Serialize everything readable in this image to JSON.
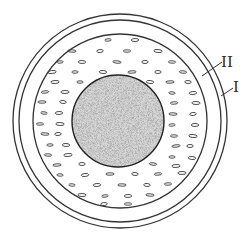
{
  "diagram": {
    "type": "concentric-cross-section",
    "colors": {
      "background": "#ffffff",
      "stroke": "#333333",
      "core_fill": "#d6d6d6",
      "core_speckle": "#8a8a8a"
    },
    "center": [
      120,
      121
    ],
    "rings": [
      {
        "name": "outer-layer",
        "r": 107
      },
      {
        "name": "second-layer",
        "r": 101
      },
      {
        "name": "dashed-region-boundary",
        "r": 87
      }
    ],
    "core": {
      "cx": 118,
      "cy": 121,
      "r": 46,
      "texture": "stippled"
    },
    "labels": [
      {
        "id": "II",
        "text": "II",
        "x": 221,
        "y": 67,
        "leader": [
          [
            202,
            76
          ],
          [
            222,
            62
          ]
        ]
      },
      {
        "id": "I",
        "text": "I",
        "x": 233,
        "y": 92,
        "leader": [
          [
            221,
            96
          ],
          [
            233,
            88
          ]
        ]
      }
    ],
    "dashes": [
      [
        108,
        40
      ],
      [
        135,
        40
      ],
      [
        72,
        51
      ],
      [
        100,
        51
      ],
      [
        127,
        51
      ],
      [
        158,
        51
      ],
      [
        60,
        62
      ],
      [
        82,
        62
      ],
      [
        117,
        62
      ],
      [
        145,
        62
      ],
      [
        172,
        62
      ],
      [
        52,
        72
      ],
      [
        75,
        72
      ],
      [
        103,
        72
      ],
      [
        132,
        72
      ],
      [
        158,
        72
      ],
      [
        183,
        72
      ],
      [
        55,
        82
      ],
      [
        80,
        82
      ],
      [
        150,
        82
      ],
      [
        170,
        82
      ],
      [
        188,
        82
      ],
      [
        45,
        92
      ],
      [
        65,
        92
      ],
      [
        172,
        93
      ],
      [
        193,
        93
      ],
      [
        42,
        102
      ],
      [
        63,
        102
      ],
      [
        174,
        103
      ],
      [
        196,
        103
      ],
      [
        44,
        113
      ],
      [
        59,
        113
      ],
      [
        173,
        114
      ],
      [
        193,
        114
      ],
      [
        40,
        124
      ],
      [
        60,
        124
      ],
      [
        172,
        125
      ],
      [
        195,
        125
      ],
      [
        45,
        134
      ],
      [
        58,
        134
      ],
      [
        174,
        136
      ],
      [
        193,
        136
      ],
      [
        50,
        145
      ],
      [
        66,
        145
      ],
      [
        176,
        146
      ],
      [
        190,
        146
      ],
      [
        48,
        155
      ],
      [
        68,
        155
      ],
      [
        172,
        157
      ],
      [
        192,
        158
      ],
      [
        57,
        165
      ],
      [
        82,
        164
      ],
      [
        153,
        164
      ],
      [
        176,
        166
      ],
      [
        60,
        175
      ],
      [
        85,
        175
      ],
      [
        110,
        174
      ],
      [
        135,
        174
      ],
      [
        158,
        174
      ],
      [
        182,
        173
      ],
      [
        72,
        185
      ],
      [
        97,
        185
      ],
      [
        122,
        185
      ],
      [
        147,
        185
      ],
      [
        168,
        184
      ],
      [
        82,
        195
      ],
      [
        105,
        196
      ],
      [
        128,
        196
      ],
      [
        150,
        195
      ],
      [
        104,
        204
      ],
      [
        128,
        204
      ]
    ]
  }
}
